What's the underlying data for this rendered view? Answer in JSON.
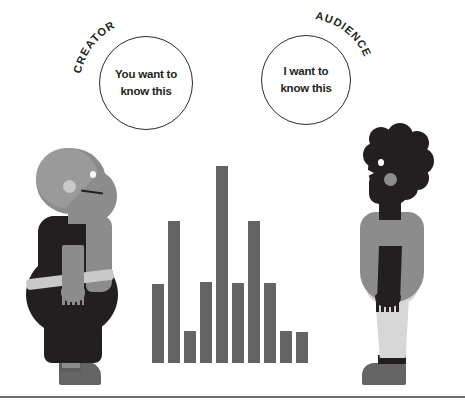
{
  "canvas": {
    "width": 465,
    "height": 407,
    "background": "#ffffff"
  },
  "palette": {
    "bar_gray": "#646464",
    "dark": "#231f20",
    "mid_gray": "#8c8c8c",
    "light_gray": "#c9c9c9",
    "lighter_gray": "#a8a8a8",
    "pale_gray": "#d7d7d7",
    "outline": "#2b2b2b",
    "white": "#ffffff",
    "rule": "#6d6d6d"
  },
  "bubbles": [
    {
      "id": "creator",
      "arc_label": "CREATOR",
      "text": "You want to\nknow this",
      "cx": 146,
      "cy": 83,
      "r": 47
    },
    {
      "id": "audience",
      "arc_label": "AUDIENCE",
      "text": "I want to\nknow this",
      "cx": 306,
      "cy": 80,
      "r": 45
    }
  ],
  "figures": [
    {
      "id": "creator-figure",
      "side": "left",
      "label": "creator-person"
    },
    {
      "id": "audience-figure",
      "side": "right",
      "label": "audience-person"
    }
  ],
  "chart_data": {
    "type": "bar",
    "title": "",
    "xlabel": "",
    "ylabel": "",
    "grid": false,
    "legend": null,
    "categories": [
      "1",
      "2",
      "3",
      "4",
      "5",
      "6",
      "7",
      "8",
      "9",
      "10"
    ],
    "values": [
      79,
      142,
      32,
      81,
      197,
      80,
      142,
      80,
      32,
      31
    ],
    "ylim": [
      0,
      203
    ],
    "bar_color": "#646464",
    "bar_width_px": 12,
    "bar_gap_px": 4,
    "baseline_y_px": 363
  }
}
